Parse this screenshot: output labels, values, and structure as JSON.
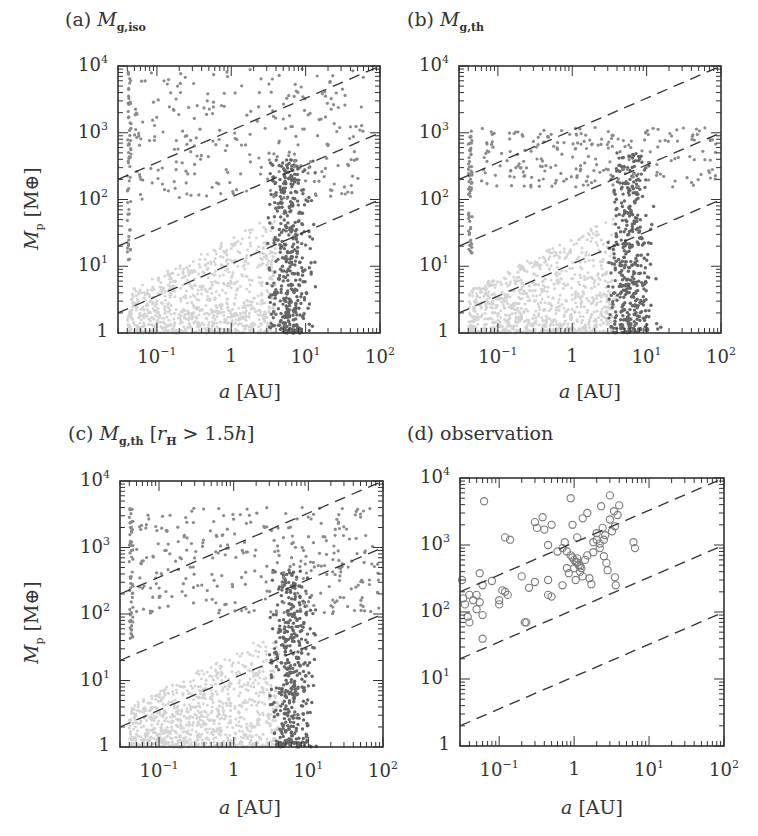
{
  "figure": {
    "y_axis_label_main": "M",
    "y_axis_label_sub": "p",
    "y_axis_label_unit": "[M⊕]",
    "x_axis_label_var": "a",
    "x_axis_label_unit": "[AU]",
    "x_tick_labels": [
      {
        "base": "10",
        "exp": "−1",
        "value": 0.1
      },
      {
        "base": "1",
        "exp": "",
        "value": 1
      },
      {
        "base": "10",
        "exp": "1",
        "value": 10
      },
      {
        "base": "10",
        "exp": "2",
        "value": 100
      }
    ],
    "y_tick_labels": [
      {
        "base": "1",
        "exp": "",
        "value": 1
      },
      {
        "base": "10",
        "exp": "1",
        "value": 10
      },
      {
        "base": "10",
        "exp": "2",
        "value": 100
      },
      {
        "base": "10",
        "exp": "3",
        "value": 1000
      },
      {
        "base": "10",
        "exp": "4",
        "value": 10000
      }
    ]
  },
  "panels": [
    {
      "id": "a",
      "label": "(a)",
      "title_var": "M",
      "title_sub": "g,iso",
      "title_extra": ""
    },
    {
      "id": "b",
      "label": "(b)",
      "title_var": "M",
      "title_sub": "g,th",
      "title_extra": ""
    },
    {
      "id": "c",
      "label": "(c)",
      "title_var": "M",
      "title_sub": "g,th",
      "title_extra": "[r_H > 1.5h]"
    },
    {
      "id": "d",
      "label": "(d)",
      "title_var": "",
      "title_sub": "",
      "title_extra": "observation"
    }
  ],
  "colors": {
    "frame": "#333333",
    "dashed": "#333333",
    "light_points": "#d4d4d4",
    "mid_points": "#8a8a8a",
    "dark_points": "#666666",
    "obs_circles": "#7a7a7a"
  },
  "chart_data": [
    {
      "type": "scatter",
      "title": "(a) M_g,iso",
      "xlabel": "a [AU]",
      "ylabel": "M_p [M⊕]",
      "xscale": "log",
      "yscale": "log",
      "xlim": [
        0.03,
        100
      ],
      "ylim": [
        1,
        10000
      ],
      "grid": false,
      "dashed_lines": [
        {
          "formula": "M = 1000 a^0.5",
          "left": [
            0.03,
            200
          ],
          "right": [
            100,
            10000
          ]
        },
        {
          "formula": "M = 100 a^0.5",
          "left": [
            0.03,
            20
          ],
          "right": [
            100,
            1000
          ]
        },
        {
          "formula": "M = 10 a^0.5",
          "left": [
            0.03,
            2
          ],
          "right": [
            100,
            100
          ]
        }
      ],
      "series": [
        {
          "name": "rocky planets (light)",
          "region": {
            "a": [
              0.04,
              4
            ],
            "M": [
              1,
              60
            ]
          },
          "count": 900
        },
        {
          "name": "icy planets (dark)",
          "region": {
            "a": [
              3,
              40
            ],
            "M": [
              1,
              400
            ]
          },
          "count": 420
        },
        {
          "name": "gas giants (mid)",
          "region": {
            "a": [
              0.05,
              60
            ],
            "M": [
              100,
              9000
            ]
          },
          "count": 260
        },
        {
          "name": "inner-edge pile-up",
          "region": {
            "a": [
              0.04,
              0.045
            ],
            "M": [
              10,
              9000
            ]
          },
          "count": 60
        }
      ]
    },
    {
      "type": "scatter",
      "title": "(b) M_g,th",
      "xlabel": "a [AU]",
      "ylabel": "M_p [M⊕]",
      "xscale": "log",
      "yscale": "log",
      "xlim": [
        0.03,
        100
      ],
      "ylim": [
        1,
        10000
      ],
      "grid": false,
      "dashed_lines": [
        {
          "formula": "M = 1000 a^0.5",
          "left": [
            0.03,
            200
          ],
          "right": [
            100,
            10000
          ]
        },
        {
          "formula": "M = 100 a^0.5",
          "left": [
            0.03,
            20
          ],
          "right": [
            100,
            1000
          ]
        },
        {
          "formula": "M = 10 a^0.5",
          "left": [
            0.03,
            2
          ],
          "right": [
            100,
            100
          ]
        }
      ],
      "series": [
        {
          "name": "rocky planets (light)",
          "region": {
            "a": [
              0.04,
              4
            ],
            "M": [
              1,
              60
            ]
          },
          "count": 900
        },
        {
          "name": "icy planets (dark)",
          "region": {
            "a": [
              3,
              40
            ],
            "M": [
              1,
              500
            ]
          },
          "count": 420
        },
        {
          "name": "gas giants (mid)",
          "region": {
            "a": [
              0.06,
              90
            ],
            "M": [
              150,
              1200
            ]
          },
          "count": 220
        },
        {
          "name": "inner-edge pile-up",
          "region": {
            "a": [
              0.04,
              0.045
            ],
            "M": [
              15,
              1100
            ]
          },
          "count": 60
        }
      ]
    },
    {
      "type": "scatter",
      "title": "(c) M_g,th [r_H > 1.5h]",
      "xlabel": "a [AU]",
      "ylabel": "M_p [M⊕]",
      "xscale": "log",
      "yscale": "log",
      "xlim": [
        0.03,
        100
      ],
      "ylim": [
        1,
        10000
      ],
      "grid": false,
      "dashed_lines": [
        {
          "formula": "M = 1000 a^0.5",
          "left": [
            0.03,
            200
          ],
          "right": [
            100,
            10000
          ]
        },
        {
          "formula": "M = 100 a^0.5",
          "left": [
            0.03,
            20
          ],
          "right": [
            100,
            1000
          ]
        },
        {
          "formula": "M = 10 a^0.5",
          "left": [
            0.03,
            2
          ],
          "right": [
            100,
            100
          ]
        }
      ],
      "series": [
        {
          "name": "rocky planets (light)",
          "region": {
            "a": [
              0.04,
              4
            ],
            "M": [
              1,
              60
            ]
          },
          "count": 900
        },
        {
          "name": "icy planets (dark)",
          "region": {
            "a": [
              3,
              40
            ],
            "M": [
              1,
              500
            ]
          },
          "count": 420
        },
        {
          "name": "gas giants (mid)",
          "region": {
            "a": [
              0.05,
              90
            ],
            "M": [
              100,
              4000
            ]
          },
          "count": 300
        },
        {
          "name": "inner-edge pile-up",
          "region": {
            "a": [
              0.04,
              0.045
            ],
            "M": [
              30,
              4000
            ]
          },
          "count": 60
        }
      ]
    },
    {
      "type": "scatter",
      "title": "(d) observation",
      "xlabel": "a [AU]",
      "ylabel": "M_p [M⊕]",
      "xscale": "log",
      "yscale": "log",
      "xlim": [
        0.03,
        100
      ],
      "ylim": [
        1,
        10000
      ],
      "grid": false,
      "marker": "open-circle",
      "dashed_lines": [
        {
          "formula": "M = 1000 a^0.5",
          "left": [
            0.03,
            200
          ],
          "right": [
            100,
            10000
          ]
        },
        {
          "formula": "M = 100 a^0.5",
          "left": [
            0.03,
            20
          ],
          "right": [
            100,
            1000
          ]
        },
        {
          "formula": "M = 10 a^0.5",
          "left": [
            0.03,
            2
          ],
          "right": [
            100,
            100
          ]
        }
      ],
      "points": [
        [
          0.063,
          4500
        ],
        [
          0.032,
          300
        ],
        [
          0.035,
          130
        ],
        [
          0.033,
          160
        ],
        [
          0.04,
          180
        ],
        [
          0.045,
          150
        ],
        [
          0.05,
          110
        ],
        [
          0.05,
          180
        ],
        [
          0.038,
          85
        ],
        [
          0.04,
          70
        ],
        [
          0.06,
          90
        ],
        [
          0.06,
          40
        ],
        [
          0.055,
          380
        ],
        [
          0.06,
          250
        ],
        [
          0.055,
          140
        ],
        [
          0.08,
          290
        ],
        [
          0.1,
          130
        ],
        [
          0.1,
          150
        ],
        [
          0.11,
          210
        ],
        [
          0.12,
          200
        ],
        [
          0.13,
          180
        ],
        [
          0.12,
          1300
        ],
        [
          0.14,
          1200
        ],
        [
          0.2,
          340
        ],
        [
          0.22,
          70
        ],
        [
          0.23,
          70
        ],
        [
          0.25,
          230
        ],
        [
          0.3,
          2200
        ],
        [
          0.32,
          1800
        ],
        [
          0.3,
          280
        ],
        [
          0.38,
          2600
        ],
        [
          0.4,
          1700
        ],
        [
          0.45,
          1000
        ],
        [
          0.45,
          300
        ],
        [
          0.45,
          180
        ],
        [
          0.5,
          170
        ],
        [
          0.6,
          800
        ],
        [
          0.7,
          250
        ],
        [
          0.75,
          1100
        ],
        [
          0.8,
          800
        ],
        [
          0.8,
          450
        ],
        [
          0.85,
          380
        ],
        [
          0.9,
          700
        ],
        [
          0.9,
          5000
        ],
        [
          0.95,
          2000
        ],
        [
          1.0,
          600
        ],
        [
          1.0,
          450
        ],
        [
          1.05,
          300
        ],
        [
          1.1,
          1300
        ],
        [
          1.1,
          550
        ],
        [
          1.15,
          500
        ],
        [
          1.2,
          400
        ],
        [
          1.25,
          450
        ],
        [
          1.3,
          2500
        ],
        [
          1.3,
          340
        ],
        [
          1.4,
          600
        ],
        [
          1.5,
          3000
        ],
        [
          1.5,
          700
        ],
        [
          1.6,
          320
        ],
        [
          1.7,
          260
        ],
        [
          1.8,
          1100
        ],
        [
          1.8,
          780
        ],
        [
          2.0,
          1500
        ],
        [
          2.0,
          1200
        ],
        [
          2.2,
          900
        ],
        [
          2.3,
          3800
        ],
        [
          2.4,
          1800
        ],
        [
          2.5,
          680
        ],
        [
          2.6,
          1400
        ],
        [
          2.7,
          540
        ],
        [
          2.8,
          420
        ],
        [
          3.0,
          5500
        ],
        [
          3.0,
          2400
        ],
        [
          3.2,
          1600
        ],
        [
          3.4,
          3200
        ],
        [
          3.5,
          1900
        ],
        [
          3.5,
          330
        ],
        [
          3.6,
          250
        ],
        [
          3.8,
          2800
        ],
        [
          4.0,
          3900
        ],
        [
          6.2,
          1100
        ],
        [
          6.5,
          900
        ],
        [
          1.1,
          630
        ],
        [
          1.2,
          480
        ],
        [
          0.95,
          650
        ],
        [
          1.05,
          560
        ],
        [
          2.2,
          1050
        ],
        [
          2.5,
          1200
        ],
        [
          0.7,
          900
        ],
        [
          0.5,
          2000
        ]
      ]
    }
  ]
}
